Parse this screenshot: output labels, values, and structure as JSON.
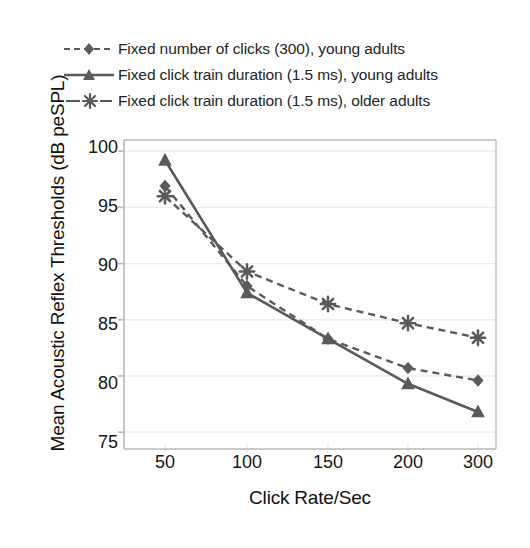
{
  "chart_data": {
    "type": "line",
    "title": "",
    "xlabel": "Click Rate/Sec",
    "ylabel": "Mean Acoustic Reflex Thresholds (dB peSPL)",
    "categories": [
      "50",
      "100",
      "150",
      "200",
      "300"
    ],
    "xticklabels": [
      "50",
      "100",
      "150",
      "200",
      "300"
    ],
    "yticklabels": [
      "100",
      "95",
      "90",
      "85",
      "80",
      "75"
    ],
    "yticks": [
      100,
      95,
      90,
      85,
      80,
      75
    ],
    "ylim": [
      73.5,
      101.0
    ],
    "grid": "horizontal-light",
    "legend_position": "above-plot-left",
    "series": [
      {
        "name": "Fixed number of clicks (300), young adults",
        "marker": "diamond",
        "linestyle": "dashed",
        "color": "#5a5a5a",
        "values": [
          96.9,
          88.0,
          83.3,
          80.7,
          79.6
        ]
      },
      {
        "name": "Fixed click train duration (1.5 ms), young adults",
        "marker": "triangle",
        "linestyle": "solid",
        "color": "#5a5a5a",
        "values": [
          99.2,
          87.4,
          83.3,
          79.3,
          76.8
        ]
      },
      {
        "name": "Fixed click train duration (1.5 ms), older adults",
        "marker": "asterisk",
        "linestyle": "dashed",
        "color": "#5a5a5a",
        "values": [
          96.0,
          89.3,
          86.4,
          84.7,
          83.4
        ]
      }
    ]
  },
  "colors": {
    "line": "#5a5a5a",
    "marker": "#5a5a5a",
    "axis": "#b8b8b8",
    "grid": "#ececec",
    "text": "#1a1a1a",
    "background": "#ffffff"
  }
}
